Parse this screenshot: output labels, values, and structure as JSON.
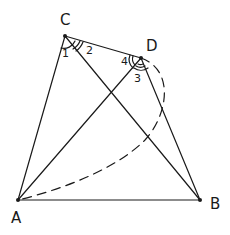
{
  "diagram": {
    "type": "geometry",
    "points": {
      "A": {
        "label": "A",
        "x": 18,
        "y": 200
      },
      "B": {
        "label": "B",
        "x": 200,
        "y": 200
      },
      "C": {
        "label": "C",
        "x": 65,
        "y": 36
      },
      "D": {
        "label": "D",
        "x": 141,
        "y": 58
      }
    },
    "segments": [
      "CA",
      "CB",
      "CD",
      "DA",
      "DB",
      "AB"
    ],
    "dashed_arc": {
      "from": "D",
      "to": "A"
    },
    "angle_labels": [
      "1",
      "2",
      "3",
      "4"
    ],
    "stroke_color": "#1a1a1a"
  }
}
